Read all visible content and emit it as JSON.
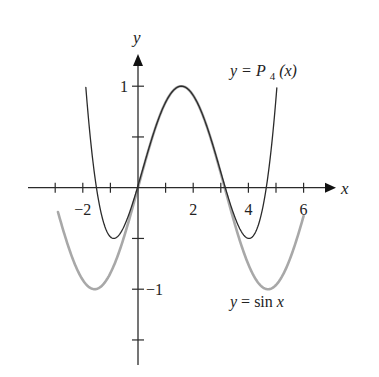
{
  "chart_data": {
    "type": "line",
    "title": "",
    "xlabel": "x",
    "ylabel": "y",
    "xlim": [
      -3.0,
      7.0
    ],
    "ylim": [
      -1.6,
      1.3
    ],
    "grid": false,
    "x_ticks": [
      -3,
      -2,
      -1,
      0,
      1,
      2,
      3,
      4,
      5,
      6
    ],
    "x_tick_labels": [
      {
        "value": -2,
        "label": "−2"
      },
      {
        "value": 2,
        "label": "2"
      },
      {
        "value": 4,
        "label": "4"
      },
      {
        "value": 6,
        "label": "6"
      }
    ],
    "y_ticks": [
      1,
      0.5,
      -0.5,
      -1,
      -1.5
    ],
    "y_tick_labels": [
      {
        "value": 1,
        "label": "1"
      },
      {
        "value": -1,
        "label": "−1"
      }
    ],
    "series": [
      {
        "name": "y = P4(x)",
        "label_parts": [
          "y = ",
          "P",
          "4",
          "(x)"
        ],
        "function": "1 - (x - pi/2)^2/2 + (x - pi/2)^4/24",
        "domain": [
          -1.89,
          5.03
        ],
        "color": "#2b2b2b",
        "label_position": "top-right"
      },
      {
        "name": "y = sin x",
        "label_parts": [
          "y",
          " = sin ",
          "x"
        ],
        "function": "sin(x)",
        "domain": [
          -2.9,
          6.0
        ],
        "color": "#a8a8a8",
        "label_position": "bottom-right"
      }
    ],
    "sample_points": {
      "P4": [
        [
          -1.89,
          1.0
        ],
        [
          -0.88,
          -0.5
        ],
        [
          0,
          0.02
        ],
        [
          1.571,
          1.0
        ],
        [
          3.14,
          0.02
        ],
        [
          4.02,
          -0.5
        ],
        [
          5.03,
          1.0
        ]
      ],
      "sin": [
        [
          -2.9,
          -0.24
        ],
        [
          -1.571,
          -1.0
        ],
        [
          0,
          0
        ],
        [
          1.571,
          1.0
        ],
        [
          3.142,
          0
        ],
        [
          4.712,
          -1.0
        ],
        [
          6.0,
          -0.28
        ]
      ]
    }
  }
}
